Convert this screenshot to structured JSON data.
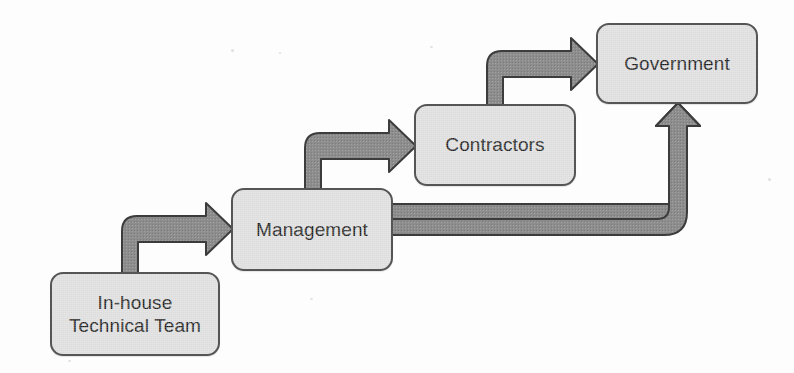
{
  "diagram": {
    "background_color": "#fdfdfd",
    "node_fill_color": "#dcdcdc",
    "node_border_color": "#555555",
    "arrow_fill_color": "#8d8d8d",
    "arrow_border_color": "#3c3c3c",
    "text_color": "#1b1b1b",
    "nodes": [
      {
        "id": "in-house-technical-team",
        "label": "In-house\nTechnical Team",
        "x": 50,
        "y": 272,
        "width": 170,
        "height": 84
      },
      {
        "id": "management",
        "label": "Management",
        "x": 231,
        "y": 188,
        "width": 162,
        "height": 83
      },
      {
        "id": "contractors",
        "label": "Contractors",
        "x": 414,
        "y": 104,
        "width": 162,
        "height": 82
      },
      {
        "id": "government",
        "label": "Government",
        "x": 596,
        "y": 23,
        "width": 162,
        "height": 81
      }
    ],
    "edges": [
      {
        "id": "edge-team-to-management",
        "from": "in-house-technical-team",
        "to": "management",
        "shape": "elbow-up-right",
        "arrowhead": "right"
      },
      {
        "id": "edge-management-to-contractors",
        "from": "management",
        "to": "contractors",
        "shape": "elbow-up-right",
        "arrowhead": "right"
      },
      {
        "id": "edge-contractors-to-government",
        "from": "contractors",
        "to": "government",
        "shape": "elbow-up-right",
        "arrowhead": "right"
      },
      {
        "id": "edge-management-to-government",
        "from": "management",
        "to": "government",
        "shape": "elbow-right-up",
        "arrowhead": "up"
      }
    ]
  }
}
